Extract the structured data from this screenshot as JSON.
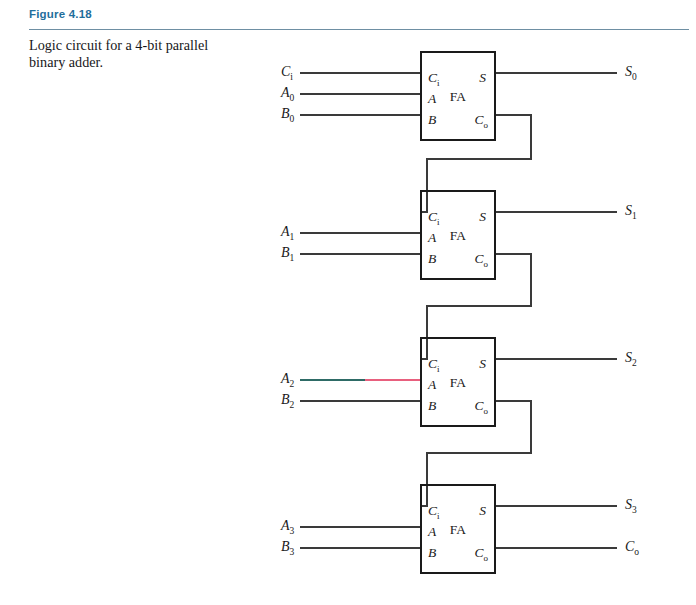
{
  "figure": {
    "label": "Figure 4.18",
    "caption": "Logic circuit for a 4-bit parallel binary adder.",
    "label_color": "#1f6e9c",
    "rule_color": "#6e8fa3"
  },
  "diagram": {
    "type": "logic-circuit",
    "wire_color": "#3a3a3a",
    "box_border_color": "#1a1a1a",
    "anomaly_wire_colors": {
      "a2_left_segment": "#2e6b66",
      "a2_right_segment": "#e8607e",
      "block3_top_edge": "#2f6f5e"
    },
    "block_pins": {
      "carry_in": "C",
      "carry_in_sub": "i",
      "input_a": "A",
      "input_b": "B",
      "sum": "S",
      "carry_out": "C",
      "carry_out_sub": "o",
      "name": "FA"
    },
    "blocks": [
      {
        "id": "fa0",
        "name": "FA",
        "inputs": [
          {
            "label": "C",
            "sub": "i"
          },
          {
            "label": "A",
            "sub": "0"
          },
          {
            "label": "B",
            "sub": "0"
          }
        ],
        "outputs": [
          {
            "label": "S",
            "sub": "0"
          }
        ],
        "carry_out_to": "fa1"
      },
      {
        "id": "fa1",
        "name": "FA",
        "inputs": [
          {
            "label": "A",
            "sub": "1"
          },
          {
            "label": "B",
            "sub": "1"
          }
        ],
        "outputs": [
          {
            "label": "S",
            "sub": "1"
          }
        ],
        "carry_in_from": "fa0",
        "carry_out_to": "fa2"
      },
      {
        "id": "fa2",
        "name": "FA",
        "inputs": [
          {
            "label": "A",
            "sub": "2"
          },
          {
            "label": "B",
            "sub": "2"
          }
        ],
        "outputs": [
          {
            "label": "S",
            "sub": "2"
          }
        ],
        "carry_in_from": "fa1",
        "carry_out_to": "fa3"
      },
      {
        "id": "fa3",
        "name": "FA",
        "inputs": [
          {
            "label": "A",
            "sub": "3"
          },
          {
            "label": "B",
            "sub": "3"
          }
        ],
        "outputs": [
          {
            "label": "S",
            "sub": "3"
          },
          {
            "label": "C",
            "sub": "o"
          }
        ],
        "carry_in_from": "fa2"
      }
    ]
  }
}
